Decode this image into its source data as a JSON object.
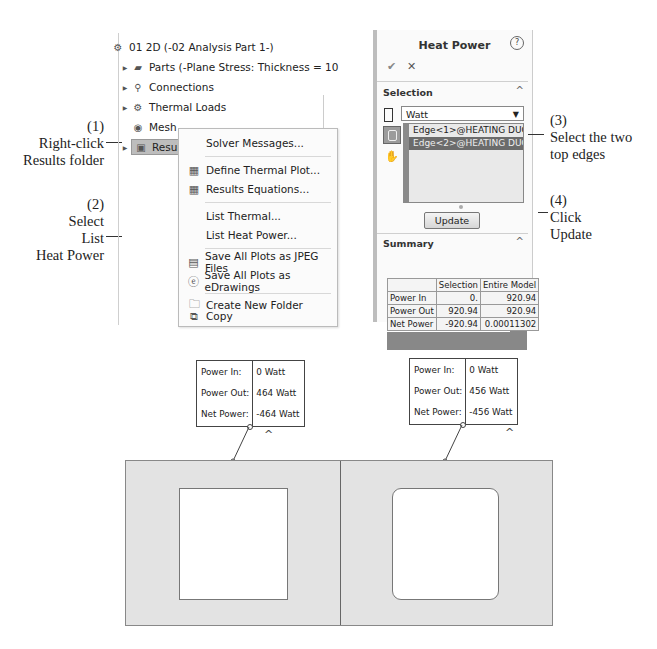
{
  "callouts": {
    "step1": {
      "num": "(1)",
      "line1": "Right-click",
      "line2": "Results folder"
    },
    "step2": {
      "num": "(2)",
      "line1": "Select",
      "line2": "List",
      "line3": "Heat Power"
    },
    "step3": {
      "num": "(3)",
      "line1": "Select the two",
      "line2": "top edges"
    },
    "step4": {
      "num": "(4)",
      "line1": "Click",
      "line2": "Update"
    }
  },
  "tree": {
    "root": {
      "label": "01 2D (-02 Analysis Part 1-)",
      "icon": "thermal-study-icon"
    },
    "items": [
      {
        "label": "Parts (-Plane Stress: Thickness = 10",
        "icon": "parts-icon",
        "expandable": true
      },
      {
        "label": "Connections",
        "icon": "connections-icon",
        "expandable": true
      },
      {
        "label": "Thermal Loads",
        "icon": "thermal-loads-icon",
        "expandable": true
      },
      {
        "label": "Mesh",
        "icon": "mesh-icon",
        "expandable": false
      },
      {
        "label": "Results",
        "icon": "results-folder-icon",
        "expandable": true,
        "selected": true
      }
    ]
  },
  "context_menu": {
    "items": [
      {
        "label": "Solver Messages...",
        "icon": ""
      },
      {
        "label": "Define Thermal Plot...",
        "icon": "thermal-plot-icon"
      },
      {
        "label": "Results Equations...",
        "icon": "results-equations-icon",
        "underline": "R"
      },
      {
        "label": "List Thermal...",
        "icon": ""
      },
      {
        "label": "List Heat Power...",
        "icon": ""
      },
      {
        "label": "Save All Plots as JPEG Files",
        "icon": "save-jpeg-icon",
        "underline": "J"
      },
      {
        "label": "Save All Plots as eDrawings",
        "icon": "edrawings-icon",
        "underline": "e"
      },
      {
        "label": "Create New Folder",
        "icon": "folder-icon"
      },
      {
        "label": "Copy",
        "icon": "copy-icon",
        "underline": "C"
      }
    ]
  },
  "property_manager": {
    "title": "Heat Power",
    "help_label": "?",
    "ok_label": "✔",
    "cancel_label": "✕",
    "selection": {
      "header": "Selection",
      "unit": "Watt",
      "selected_entities": [
        "Edge<1>@HEATING DUCTS",
        "Edge<2>@HEATING DUCTS"
      ]
    },
    "update_label": "Update",
    "summary": {
      "header": "Summary",
      "columns": [
        "",
        "Selection",
        "Entire Model"
      ],
      "rows": [
        {
          "label": "Power In",
          "selection": "0.",
          "entire_model": "920.94"
        },
        {
          "label": "Power Out",
          "selection": "920.94",
          "entire_model": "920.94"
        },
        {
          "label": "Net Power",
          "selection": "-920.94",
          "entire_model": "0.00011302"
        }
      ]
    }
  },
  "model_view": {
    "left_result": {
      "labels": [
        "Power In:",
        "Power Out:",
        "Net Power:"
      ],
      "values": [
        "0 Watt",
        "464 Watt",
        "-464 Watt"
      ]
    },
    "right_result": {
      "labels": [
        "Power In:",
        "Power Out:",
        "Net Power:"
      ],
      "values": [
        "0 Watt",
        "456 Watt",
        "-456 Watt"
      ]
    }
  }
}
